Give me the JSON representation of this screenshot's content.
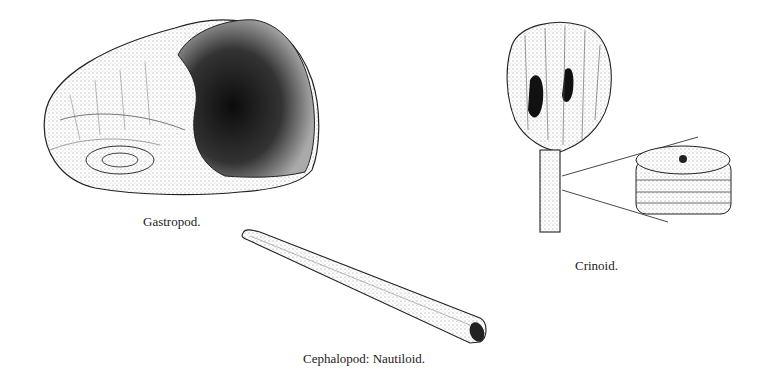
{
  "figures": [
    {
      "id": "gastropod",
      "label": "Gastropod."
    },
    {
      "id": "nautiloid",
      "label": "Cephalopod: Nautiloid."
    },
    {
      "id": "crinoid",
      "label": "Crinoid."
    }
  ],
  "colors": {
    "ink": "#1a1a1a",
    "background": "#ffffff",
    "stipple": "#555555"
  }
}
